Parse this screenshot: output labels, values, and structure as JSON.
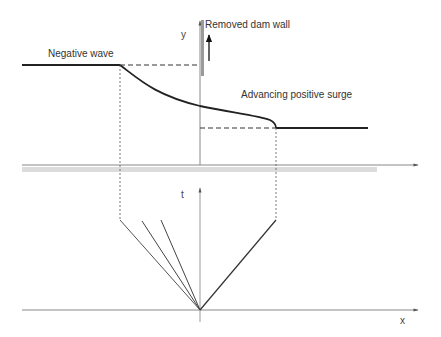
{
  "diagram": {
    "type": "dam-break wave profile and characteristics diagram",
    "labels": {
      "negative_wave": "Negative wave",
      "removed_dam_wall": "Removed dam wall",
      "advancing_positive_surge": "Advancing positive surge"
    },
    "axes": {
      "upper_vertical": "y",
      "lower_vertical": "t",
      "lower_horizontal": "x"
    },
    "colors": {
      "line": "#222222",
      "axis": "#777777",
      "dam_wall": "#9a9a9a",
      "ground_band": "#d8d8d8"
    }
  }
}
